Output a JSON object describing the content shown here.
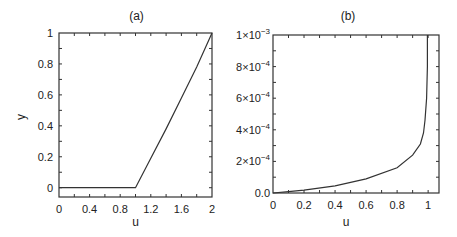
{
  "chart_data": [
    {
      "type": "line",
      "title": "(a)",
      "xlabel": "u",
      "ylabel": "y",
      "xlim": [
        0,
        2
      ],
      "ylim": [
        -0.06,
        1
      ],
      "xticks": [
        "0",
        "0.4",
        "0.8",
        "1.2",
        "1.6",
        "2"
      ],
      "xtick_values": [
        0,
        0.4,
        0.8,
        1.2,
        1.6,
        2
      ],
      "yticks": [
        "0",
        "0.2",
        "0.4",
        "0.6",
        "0.8",
        "1"
      ],
      "ytick_values": [
        0,
        0.2,
        0.4,
        0.6,
        0.8,
        1
      ],
      "grid": false,
      "series": [
        {
          "name": "y(u)",
          "x": [
            0,
            0.5,
            1.0,
            1.2,
            1.4,
            1.6,
            1.8,
            2.0
          ],
          "y": [
            0,
            0,
            0,
            0.19,
            0.38,
            0.58,
            0.78,
            1.0
          ]
        }
      ]
    },
    {
      "type": "line",
      "title": "(b)",
      "xlabel": "u",
      "ylabel": "",
      "xlim": [
        0,
        1.07
      ],
      "ylim": [
        0,
        0.001
      ],
      "xticks": [
        "0",
        "0.2",
        "0.4",
        "0.6",
        "0.8",
        "1"
      ],
      "xtick_values": [
        0,
        0.2,
        0.4,
        0.6,
        0.8,
        1
      ],
      "yticks": [
        "0.0",
        "2×10^-4",
        "4×10^-4",
        "6×10^-4",
        "8×10^-4",
        "1×10^-3"
      ],
      "ytick_values": [
        0,
        0.0002,
        0.0004,
        0.0006,
        0.0008,
        0.001
      ],
      "grid": false,
      "series": [
        {
          "name": "curve",
          "x": [
            0,
            0.1,
            0.2,
            0.4,
            0.6,
            0.8,
            0.9,
            0.95,
            0.97,
            0.98,
            0.99,
            0.995,
            0.995
          ],
          "y": [
            0,
            8e-06,
            1.8e-05,
            4.5e-05,
            9e-05,
            0.00016,
            0.00024,
            0.00031,
            0.00038,
            0.00046,
            0.0006,
            0.0008,
            0.001
          ]
        }
      ]
    }
  ],
  "labels": {
    "a_title": "(a)",
    "b_title": "(b)",
    "a_xlabel": "u",
    "a_ylabel": "y",
    "b_xlabel": "u",
    "a_xticks": [
      "0",
      "0.4",
      "0.8",
      "1.2",
      "1.6",
      "2"
    ],
    "a_yticks": [
      "0",
      "0.2",
      "0.4",
      "0.6",
      "0.8",
      "1"
    ],
    "b_xticks": [
      "0",
      "0.2",
      "0.4",
      "0.6",
      "0.8",
      "1"
    ],
    "b_ytick_mantissa": [
      "0.0",
      "2×10",
      "4×10",
      "6×10",
      "8×10",
      "1×10"
    ],
    "b_ytick_exp": [
      "",
      "−4",
      "−4",
      "−4",
      "−4",
      "−3"
    ]
  }
}
